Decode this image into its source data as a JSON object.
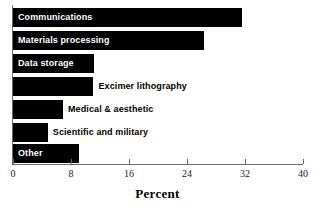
{
  "chart_data": {
    "type": "bar",
    "orientation": "horizontal",
    "title": "",
    "xlabel": "Percent",
    "ylabel": "",
    "xlim": [
      0,
      40
    ],
    "xticks": [
      0,
      8,
      16,
      24,
      32,
      40
    ],
    "xticklabels": [
      "0",
      "8",
      "16",
      "24",
      "32",
      "40"
    ],
    "grid": false,
    "legend": null,
    "bar_color": "#000000",
    "categories": [
      "Communications",
      "Materials processing",
      "Data storage",
      "Excimer lithography",
      "Medical & aesthetic",
      "Scientific and military",
      "Other"
    ],
    "values": [
      31.6,
      26.3,
      11.2,
      11.1,
      6.9,
      4.8,
      9.1
    ],
    "bars": [
      {
        "label": "Communications",
        "value": 31.6,
        "label_position": "inside",
        "label_color": "#ffffff"
      },
      {
        "label": "Materials processing",
        "value": 26.3,
        "label_position": "inside",
        "label_color": "#ffffff"
      },
      {
        "label": "Data storage",
        "value": 11.2,
        "label_position": "inside",
        "label_color": "#ffffff"
      },
      {
        "label": "Excimer lithography",
        "value": 11.1,
        "label_position": "outside",
        "label_color": "#000000"
      },
      {
        "label": "Medical & aesthetic",
        "value": 6.9,
        "label_position": "outside",
        "label_color": "#000000"
      },
      {
        "label": "Scientific and military",
        "value": 4.8,
        "label_position": "outside",
        "label_color": "#000000"
      },
      {
        "label": "Other",
        "value": 9.1,
        "label_position": "inside",
        "label_color": "#ffffff"
      }
    ]
  }
}
